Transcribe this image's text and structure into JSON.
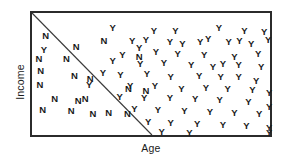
{
  "chart_data": {
    "type": "scatter",
    "title": "",
    "xlabel": "Age",
    "ylabel": "Income",
    "grid": false,
    "legend": null,
    "xlim": [
      0,
      100
    ],
    "ylim": [
      0,
      100
    ],
    "annotations": [
      {
        "name": "decision-boundary",
        "type": "line",
        "from": [
          0,
          100
        ],
        "to": [
          50.4,
          0
        ]
      }
    ],
    "class_labels": [
      "Y",
      "N"
    ],
    "series": [
      {
        "name": "Y",
        "label": "Y",
        "points": [
          [
            33.9,
            88.1
          ],
          [
            51.2,
            84.9
          ],
          [
            60.3,
            84.9
          ],
          [
            78.5,
            87.3
          ],
          [
            89.3,
            84.9
          ],
          [
            97.5,
            84.1
          ],
          [
            42.1,
            77.0
          ],
          [
            47.9,
            77.8
          ],
          [
            57.9,
            76.2
          ],
          [
            63.2,
            74.6
          ],
          [
            70.7,
            76.2
          ],
          [
            74.0,
            78.6
          ],
          [
            82.6,
            76.2
          ],
          [
            87.2,
            77.0
          ],
          [
            92.1,
            74.6
          ],
          [
            99.2,
            77.8
          ],
          [
            45.0,
            71.4
          ],
          [
            5.0,
            69.8
          ],
          [
            38.0,
            65.9
          ],
          [
            52.1,
            68.3
          ],
          [
            61.2,
            66.7
          ],
          [
            72.3,
            65.9
          ],
          [
            85.1,
            64.3
          ],
          [
            95.0,
            66.7
          ],
          [
            33.9,
            60.3
          ],
          [
            45.5,
            57.9
          ],
          [
            55.4,
            58.7
          ],
          [
            66.9,
            57.1
          ],
          [
            76.0,
            55.6
          ],
          [
            80.2,
            57.9
          ],
          [
            86.8,
            57.1
          ],
          [
            96.3,
            55.6
          ],
          [
            29.8,
            50.8
          ],
          [
            37.2,
            49.2
          ],
          [
            48.3,
            50.0
          ],
          [
            58.3,
            47.6
          ],
          [
            70.2,
            48.4
          ],
          [
            79.3,
            47.6
          ],
          [
            86.8,
            47.6
          ],
          [
            94.2,
            44.4
          ],
          [
            24.0,
            41.3
          ],
          [
            41.3,
            40.5
          ],
          [
            51.7,
            40.5
          ],
          [
            62.8,
            38.1
          ],
          [
            73.1,
            38.9
          ],
          [
            82.2,
            38.1
          ],
          [
            92.6,
            36.5
          ],
          [
            99.6,
            34.1
          ],
          [
            36.8,
            31.0
          ],
          [
            47.1,
            30.2
          ],
          [
            57.9,
            30.2
          ],
          [
            68.6,
            29.4
          ],
          [
            78.9,
            28.6
          ],
          [
            90.9,
            27.0
          ],
          [
            99.6,
            23.0
          ],
          [
            43.0,
            21.4
          ],
          [
            52.9,
            20.6
          ],
          [
            64.0,
            19.8
          ],
          [
            74.8,
            19.0
          ],
          [
            85.1,
            18.3
          ],
          [
            95.5,
            17.5
          ],
          [
            48.8,
            10.3
          ],
          [
            58.3,
            9.5
          ],
          [
            69.4,
            8.7
          ],
          [
            80.2,
            7.9
          ],
          [
            90.1,
            7.1
          ],
          [
            99.6,
            5.6
          ],
          [
            54.5,
            2.4
          ],
          [
            66.1,
            1.6
          ],
          [
            99.6,
            1.6
          ]
        ]
      },
      {
        "name": "N",
        "label": "N",
        "points": [
          [
            5.8,
            81.0
          ],
          [
            18.6,
            72.2
          ],
          [
            30.2,
            77.0
          ],
          [
            2.9,
            61.9
          ],
          [
            14.5,
            61.9
          ],
          [
            45.0,
            64.3
          ],
          [
            3.7,
            52.4
          ],
          [
            17.8,
            48.4
          ],
          [
            24.4,
            46.0
          ],
          [
            3.3,
            41.3
          ],
          [
            40.5,
            38.1
          ],
          [
            47.9,
            35.7
          ],
          [
            9.5,
            29.4
          ],
          [
            19.4,
            27.8
          ],
          [
            22.3,
            29.4
          ],
          [
            4.5,
            20.6
          ],
          [
            16.5,
            19.8
          ],
          [
            25.6,
            17.5
          ],
          [
            32.2,
            18.3
          ],
          [
            40.1,
            17.5
          ]
        ]
      }
    ]
  },
  "axes": {
    "x_label": "Age",
    "y_label": "Income"
  },
  "markers": {
    "yes": "Y",
    "no": "N"
  },
  "colors": {
    "frame": "#2b2b2b",
    "boundary": "#3a3a3a",
    "marker": "#1a1a1a",
    "background": "#ffffff"
  }
}
